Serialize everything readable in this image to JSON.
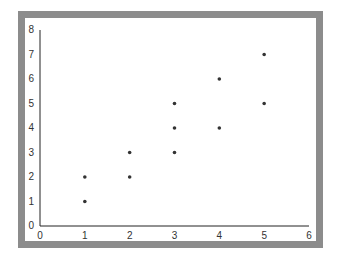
{
  "chart_data": {
    "type": "scatter",
    "title": "",
    "xlabel": "",
    "ylabel": "",
    "xlim": [
      0,
      6
    ],
    "ylim": [
      0,
      8
    ],
    "grid": false,
    "legend": null,
    "x_ticks": [
      "0",
      "1",
      "2",
      "3",
      "4",
      "5",
      "6"
    ],
    "y_ticks": [
      "0",
      "1",
      "2",
      "3",
      "4",
      "5",
      "6",
      "7",
      "8"
    ],
    "series": [
      {
        "name": "points",
        "points": [
          {
            "x": 1,
            "y": 1
          },
          {
            "x": 1,
            "y": 2
          },
          {
            "x": 2,
            "y": 2
          },
          {
            "x": 2,
            "y": 3
          },
          {
            "x": 3,
            "y": 3
          },
          {
            "x": 3,
            "y": 4
          },
          {
            "x": 3,
            "y": 5
          },
          {
            "x": 4,
            "y": 4
          },
          {
            "x": 4,
            "y": 6
          },
          {
            "x": 5,
            "y": 5
          },
          {
            "x": 5,
            "y": 7
          }
        ]
      }
    ]
  },
  "colors": {
    "frame": "#8c8c8c",
    "axis": "#222222",
    "marker": "#333333",
    "background": "#ffffff"
  }
}
